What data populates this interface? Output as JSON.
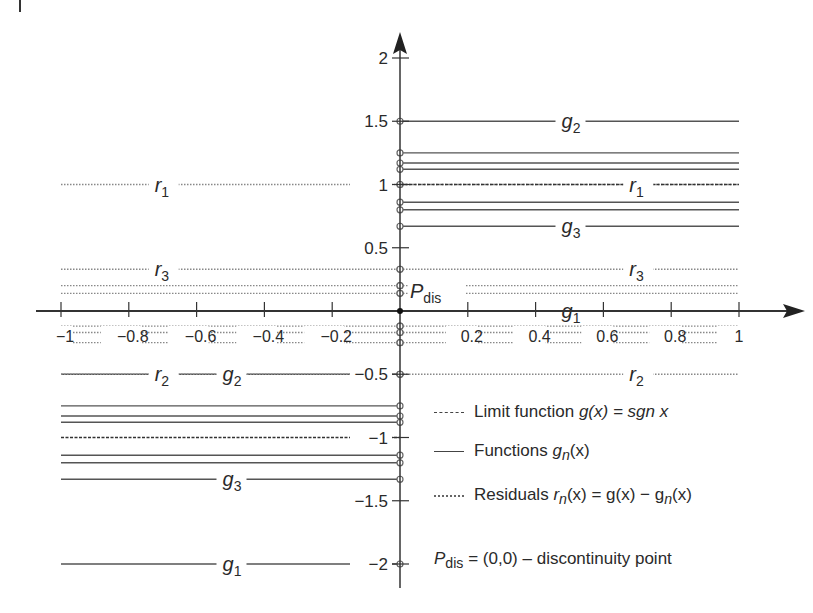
{
  "chart_data": {
    "type": "line",
    "title": "",
    "xlabel": "",
    "ylabel": "",
    "xlim": [
      -1,
      1
    ],
    "ylim": [
      -2,
      2
    ],
    "grid": false,
    "x_ticks": [
      -1,
      -0.8,
      -0.6,
      -0.4,
      -0.2,
      0.2,
      0.4,
      0.6,
      0.8,
      1
    ],
    "x_tick_labels": [
      "−1",
      "−0.8",
      "−0.6",
      "−0.4",
      "−0.2",
      "0.2",
      "0.4",
      "0.6",
      "0.8",
      "1"
    ],
    "y_ticks": [
      2,
      1.5,
      1,
      0.5,
      -0.5,
      -1,
      -1.5,
      -2
    ],
    "y_tick_labels": [
      "2",
      "1.5",
      "1",
      "0.5",
      "−0.5",
      "−1",
      "−1.5",
      "−2"
    ],
    "limit_function": {
      "name": "g(x) = sgn x",
      "style": "dashed",
      "segments": [
        {
          "x": [
            -1,
            0
          ],
          "y": -1
        },
        {
          "x": [
            0,
            1
          ],
          "y": 1
        }
      ]
    },
    "series": [
      {
        "name": "g1",
        "style": "solid",
        "left_value": -2,
        "right_value": 0
      },
      {
        "name": "g2",
        "style": "solid",
        "left_value": -0.5,
        "right_value": 1.5
      },
      {
        "name": "g3",
        "style": "solid",
        "left_value": -1.33,
        "right_value": 0.67
      },
      {
        "name": "g4",
        "style": "solid",
        "left_value": -0.75,
        "right_value": 1.25
      },
      {
        "name": "g5",
        "style": "solid",
        "left_value": -1.2,
        "right_value": 0.8
      },
      {
        "name": "g6",
        "style": "solid",
        "left_value": -0.83,
        "right_value": 1.17
      },
      {
        "name": "g7",
        "style": "solid",
        "left_value": -1.14,
        "right_value": 0.86
      },
      {
        "name": "g8",
        "style": "solid",
        "left_value": -0.88,
        "right_value": 1.12
      },
      {
        "name": "r1",
        "style": "dotted",
        "left_value": 1,
        "right_value": 1
      },
      {
        "name": "r2",
        "style": "dotted",
        "left_value": -0.5,
        "right_value": -0.5
      },
      {
        "name": "r3",
        "style": "dotted",
        "left_value": 0.33,
        "right_value": 0.33
      },
      {
        "name": "r4",
        "style": "dotted",
        "left_value": -0.25,
        "right_value": -0.25
      },
      {
        "name": "r5",
        "style": "dotted",
        "left_value": 0.2,
        "right_value": 0.2
      },
      {
        "name": "r6",
        "style": "dotted",
        "left_value": -0.17,
        "right_value": -0.17
      },
      {
        "name": "r7",
        "style": "dotted",
        "left_value": 0.14,
        "right_value": 0.14
      },
      {
        "name": "r8",
        "style": "dotted",
        "left_value": -0.12,
        "right_value": -0.12
      }
    ],
    "annotations": [
      {
        "text": "P_dis",
        "x": 0,
        "y": 0,
        "note": "discontinuity point"
      },
      {
        "text": "g1",
        "x": 0.5,
        "y": 0
      },
      {
        "text": "g1",
        "x": -0.5,
        "y": -2
      },
      {
        "text": "g2",
        "x": 0.5,
        "y": 1.5
      },
      {
        "text": "g2",
        "x": -0.5,
        "y": -0.5
      },
      {
        "text": "g3",
        "x": 0.5,
        "y": 0.67
      },
      {
        "text": "g3",
        "x": -0.5,
        "y": -1.33
      },
      {
        "text": "r1",
        "x": -0.7,
        "y": 1
      },
      {
        "text": "r1",
        "x": 0.7,
        "y": 1
      },
      {
        "text": "r2",
        "x": -0.7,
        "y": -0.5
      },
      {
        "text": "r2",
        "x": 0.7,
        "y": -0.5
      },
      {
        "text": "r3",
        "x": -0.7,
        "y": 0.33
      },
      {
        "text": "r3",
        "x": 0.7,
        "y": 0.33
      }
    ],
    "legend": [
      {
        "style": "dashed",
        "label": "Limit function g(x) = sgn x"
      },
      {
        "style": "solid",
        "label": "Functions g_n(x)"
      },
      {
        "style": "dotted",
        "label": "Residuals r_n(x) = g(x) − g_n(x)"
      },
      {
        "style": "none",
        "label": "P_dis = (0,0) – discontinuity point"
      }
    ],
    "legend_position": "lower right"
  },
  "legend": {
    "limit_prefix": "Limit function ",
    "limit_formula": "g(x) = sgn x",
    "functions_prefix": "Functions ",
    "functions_formula": "g",
    "functions_sub": "n",
    "functions_suffix": "(x)",
    "residuals_prefix": "Residuals ",
    "residuals_r": "r",
    "residuals_sub": "n",
    "residuals_mid": "(x) = g(x) − g",
    "residuals_sub2": "n",
    "residuals_suffix": "(x)",
    "pdis_p": "P",
    "pdis_sub": "dis",
    "pdis_text": " = (0,0) – discontinuity point"
  }
}
